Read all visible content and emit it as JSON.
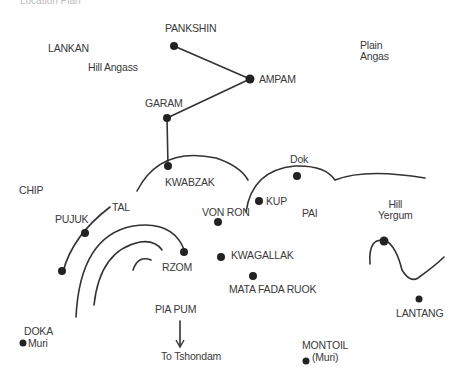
{
  "map": {
    "header_faint": "Location Plan",
    "colors": {
      "ink": "#333333",
      "dot": "#222222",
      "background": "#ffffff"
    },
    "labels": {
      "pankshin": "PANKSHIN",
      "lankan": "LANKAN",
      "hill_angass": "Hill Angass",
      "ampam": "AMPAM",
      "plain": "Plain",
      "angas": "Angas",
      "garam": "GARAM",
      "kwabzak": "KWABZAK",
      "dok": "Dok",
      "chip": "CHIP",
      "kup": "KUP",
      "pai": "PAI",
      "hill": "Hill",
      "yergum": "Yergum",
      "tal": "TAL",
      "von_ron": "VON RON",
      "pujuk": "PUJUK",
      "kwagallak": "KWAGALLAK",
      "rzom": "RZOM",
      "mata_fada_ruok": "MATA FADA RUOK",
      "lantang": "LANTANG",
      "pia_pum": "PIA PUM",
      "doka": "DOKA",
      "doka_muri": "Muri",
      "to_tshondam": "To Tshondam",
      "montoil": "MONTOIL",
      "montoil_muri": "(Muri)"
    }
  }
}
